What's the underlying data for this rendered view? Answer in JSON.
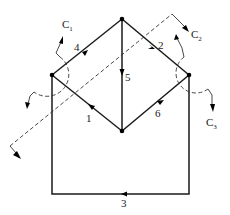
{
  "diagram": {
    "type": "graph-cutsets",
    "nodes": [
      {
        "id": "top",
        "x": 122,
        "y": 19
      },
      {
        "id": "left",
        "x": 52,
        "y": 75
      },
      {
        "id": "right",
        "x": 189,
        "y": 75
      },
      {
        "id": "bottom",
        "x": 122,
        "y": 131
      }
    ],
    "edges": [
      {
        "label": "1",
        "from": "bottom",
        "to": "left"
      },
      {
        "label": "2",
        "from": "top",
        "to": "right"
      },
      {
        "label": "3",
        "from": "right",
        "to": "left",
        "via": "bottom-loop"
      },
      {
        "label": "4",
        "from": "left",
        "to": "top"
      },
      {
        "label": "5",
        "from": "top",
        "to": "bottom"
      },
      {
        "label": "6",
        "from": "bottom",
        "to": "right"
      }
    ],
    "cutsets": [
      {
        "name": "C",
        "sub": "1",
        "style": "dashed-arc",
        "around": "left"
      },
      {
        "name": "C",
        "sub": "2",
        "style": "dashed-line"
      },
      {
        "name": "C",
        "sub": "3",
        "style": "dashed-arc",
        "around": "right"
      }
    ]
  },
  "labels": {
    "e1": "1",
    "e2": "2",
    "e3": "3",
    "e4": "4",
    "e5": "5",
    "e6": "6",
    "c": "C",
    "c1": "1",
    "c2": "2",
    "c3": "3"
  }
}
